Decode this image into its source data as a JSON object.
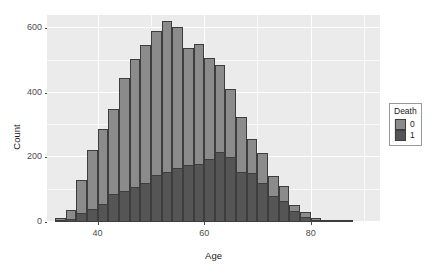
{
  "chart_data": {
    "type": "bar",
    "subtype": "histogram-overlaid",
    "title": "",
    "xlabel": "Age",
    "ylabel": "Count",
    "xlim": [
      30.5,
      93
    ],
    "ylim": [
      0,
      640
    ],
    "xticks": [
      40,
      60,
      80
    ],
    "yticks": [
      0,
      200,
      400,
      600
    ],
    "xticklabels": [
      "40",
      "60",
      "80"
    ],
    "yticklabels": [
      "0",
      "200",
      "400",
      "600"
    ],
    "grid": true,
    "grid_major_y": [
      0,
      200,
      400,
      600
    ],
    "grid_minor_y": [
      100,
      300,
      500
    ],
    "grid_major_x": [
      40,
      60,
      80
    ],
    "grid_minor_x": [
      30,
      50,
      70,
      90
    ],
    "legend": {
      "title": "Death",
      "position": "right",
      "entries": [
        {
          "label": "0",
          "color": "#8b8b8b"
        },
        {
          "label": "1",
          "color": "#555555"
        }
      ]
    },
    "bin_width": 2,
    "bin_centers": [
      33,
      35,
      37,
      39,
      41,
      43,
      45,
      47,
      49,
      51,
      53,
      55,
      57,
      59,
      61,
      63,
      65,
      67,
      69,
      71,
      73,
      75,
      77,
      79,
      81,
      83,
      85,
      87
    ],
    "series": [
      {
        "name": "0",
        "color": "#8b8b8b",
        "values": [
          12,
          38,
          130,
          222,
          288,
          350,
          444,
          505,
          547,
          590,
          620,
          603,
          537,
          549,
          506,
          486,
          412,
          325,
          257,
          213,
          143,
          111,
          53,
          30,
          12,
          5,
          2,
          1
        ]
      },
      {
        "name": "1",
        "color": "#555555",
        "values": [
          2,
          8,
          27,
          41,
          56,
          86,
          96,
          108,
          122,
          146,
          156,
          166,
          176,
          178,
          194,
          217,
          201,
          155,
          150,
          122,
          80,
          66,
          33,
          17,
          7,
          3,
          1,
          1
        ]
      }
    ],
    "panel_background": "#ebebeb",
    "bar_outline_color": "#3d3d3d"
  }
}
